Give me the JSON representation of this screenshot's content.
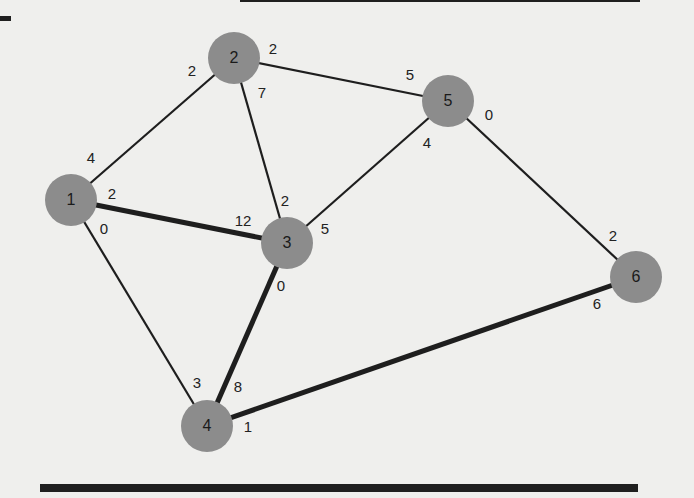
{
  "diagram": {
    "type": "weighted-graph",
    "node_color": "#8c8c8c",
    "edge_color": "#1e1e1e",
    "background": "#efefed",
    "nodes": [
      {
        "id": "1",
        "label": "1",
        "x": 71,
        "y": 200
      },
      {
        "id": "2",
        "label": "2",
        "x": 234,
        "y": 58
      },
      {
        "id": "3",
        "label": "3",
        "x": 287,
        "y": 243
      },
      {
        "id": "4",
        "label": "4",
        "x": 207,
        "y": 426
      },
      {
        "id": "5",
        "label": "5",
        "x": 448,
        "y": 101
      },
      {
        "id": "6",
        "label": "6",
        "x": 636,
        "y": 277
      }
    ],
    "edges": [
      {
        "from": "1",
        "to": "2",
        "thick": false
      },
      {
        "from": "1",
        "to": "3",
        "thick": true
      },
      {
        "from": "1",
        "to": "4",
        "thick": false
      },
      {
        "from": "2",
        "to": "3",
        "thick": false
      },
      {
        "from": "2",
        "to": "5",
        "thick": false
      },
      {
        "from": "3",
        "to": "5",
        "thick": false
      },
      {
        "from": "3",
        "to": "4",
        "thick": true
      },
      {
        "from": "5",
        "to": "6",
        "thick": false
      },
      {
        "from": "4",
        "to": "6",
        "thick": true
      }
    ],
    "edge_end_labels": [
      {
        "text": "4",
        "x": 91,
        "y": 157,
        "near": "1"
      },
      {
        "text": "2",
        "x": 112,
        "y": 193,
        "near": "1"
      },
      {
        "text": "0",
        "x": 104,
        "y": 228,
        "near": "1"
      },
      {
        "text": "2",
        "x": 192,
        "y": 70,
        "near": "2"
      },
      {
        "text": "2",
        "x": 273,
        "y": 48,
        "near": "2"
      },
      {
        "text": "7",
        "x": 262,
        "y": 92,
        "near": "2"
      },
      {
        "text": "2",
        "x": 285,
        "y": 200,
        "near": "3"
      },
      {
        "text": "12",
        "x": 243,
        "y": 220,
        "near": "3"
      },
      {
        "text": "5",
        "x": 325,
        "y": 228,
        "near": "3"
      },
      {
        "text": "0",
        "x": 281,
        "y": 285,
        "near": "3"
      },
      {
        "text": "3",
        "x": 197,
        "y": 382,
        "near": "4"
      },
      {
        "text": "8",
        "x": 238,
        "y": 386,
        "near": "4"
      },
      {
        "text": "1",
        "x": 248,
        "y": 426,
        "near": "4"
      },
      {
        "text": "5",
        "x": 410,
        "y": 74,
        "near": "5"
      },
      {
        "text": "0",
        "x": 489,
        "y": 114,
        "near": "5"
      },
      {
        "text": "4",
        "x": 427,
        "y": 142,
        "near": "5"
      },
      {
        "text": "2",
        "x": 613,
        "y": 235,
        "near": "6"
      },
      {
        "text": "6",
        "x": 597,
        "y": 303,
        "near": "6"
      }
    ],
    "node_radius": 26
  },
  "decor": {
    "top_bar": {
      "x": 240,
      "y": 0,
      "w": 400,
      "h": 2
    },
    "top_left_tick": {
      "x": 0,
      "y": 16,
      "w": 11,
      "h": 5
    },
    "bottom_bar": {
      "x": 40,
      "y": 484,
      "w": 598,
      "h": 8
    }
  }
}
